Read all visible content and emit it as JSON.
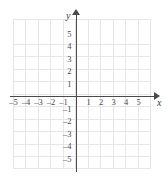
{
  "chart_data": {
    "type": "scatter",
    "title": "",
    "xlabel": "x",
    "ylabel": "y",
    "xlim": [
      -5.5,
      5.5
    ],
    "ylim": [
      -6,
      6
    ],
    "grid": true,
    "legend": null,
    "series": [],
    "x_ticks": [
      {
        "value": -5,
        "label": "–5"
      },
      {
        "value": -4,
        "label": "–4"
      },
      {
        "value": -3,
        "label": "–3"
      },
      {
        "value": -2,
        "label": "–2"
      },
      {
        "value": -1,
        "label": "–1"
      },
      {
        "value": 1,
        "label": "1"
      },
      {
        "value": 2,
        "label": "2"
      },
      {
        "value": 3,
        "label": "3"
      },
      {
        "value": 4,
        "label": "4"
      },
      {
        "value": 5,
        "label": "5"
      }
    ],
    "y_ticks": [
      {
        "value": 5,
        "label": "5"
      },
      {
        "value": 4,
        "label": "4"
      },
      {
        "value": 3,
        "label": "3"
      },
      {
        "value": 2,
        "label": "2"
      },
      {
        "value": 1,
        "label": "1"
      },
      {
        "value": -1,
        "label": "–1"
      },
      {
        "value": -2,
        "label": "–2"
      },
      {
        "value": -3,
        "label": "–3"
      },
      {
        "value": -4,
        "label": "–4"
      },
      {
        "value": -5,
        "label": "–5"
      }
    ],
    "axis_labels": {
      "x": "x",
      "y": "y"
    },
    "colors": {
      "grid": "#e6e6e6",
      "axis": "#4a4a4a",
      "text": "#4a4a4a",
      "background": "#ffffff"
    }
  }
}
